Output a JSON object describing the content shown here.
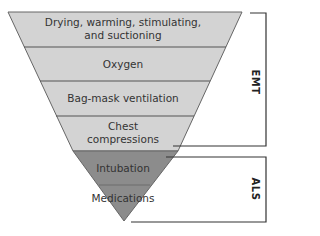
{
  "diagram": {
    "type": "inverted-pyramid",
    "levels": [
      {
        "label_line1": "Drying, warming, stimulating,",
        "label_line2": "and suctioning",
        "shade": "light"
      },
      {
        "label": "Oxygen",
        "shade": "light"
      },
      {
        "label": "Bag-mask ventilation",
        "shade": "light"
      },
      {
        "label_line1": "Chest",
        "label_line2": "compressions",
        "shade": "light"
      },
      {
        "label": "Intubation",
        "shade": "dark"
      },
      {
        "label": "Medications",
        "shade": "dark"
      }
    ],
    "brackets": [
      {
        "label": "EMT",
        "covers": "levels 1-4"
      },
      {
        "label": "ALS",
        "covers": "levels 5-6"
      }
    ],
    "colors": {
      "light_fill": "#d3d3d3",
      "dark_fill": "#8c8c8c",
      "line": "#555555",
      "bracket": "#333333"
    }
  }
}
